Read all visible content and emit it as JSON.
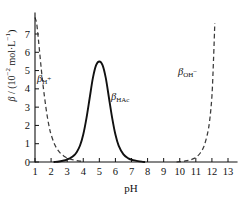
{
  "chart_data": {
    "type": "line",
    "title": "",
    "xlabel": "pH",
    "ylabel": "β / (10⁻² mol·L⁻¹)",
    "xlim": [
      1,
      13
    ],
    "ylim": [
      0,
      7.9
    ],
    "grid": false,
    "legend": "inline-annotations",
    "xticks": [
      "1",
      "2",
      "3",
      "4",
      "5",
      "6",
      "7",
      "8",
      "9",
      "10",
      "11",
      "12",
      "13"
    ],
    "xtick_values": [
      1,
      2,
      3,
      4,
      5,
      6,
      7,
      8,
      9,
      10,
      11,
      12,
      13
    ],
    "yticks": [
      "0",
      "1",
      "2",
      "3",
      "4",
      "5",
      "6",
      "7"
    ],
    "ytick_values": [
      0,
      1,
      2,
      3,
      4,
      5,
      6,
      7
    ],
    "series": [
      {
        "name": "β_H+",
        "label": "β",
        "label_sub": "H",
        "label_sup": "+",
        "style": "dashed",
        "color": "#3a3a3a",
        "x": [
          1.0,
          1.1,
          1.2,
          1.3,
          1.4,
          1.5,
          1.6,
          1.7,
          1.8,
          1.9,
          2.0,
          2.2,
          2.4,
          2.6,
          2.8,
          3.0,
          3.2,
          3.5,
          3.8,
          4.0
        ],
        "y": [
          7.9,
          7.6,
          6.8,
          5.9,
          5.0,
          4.2,
          3.5,
          2.85,
          2.3,
          1.85,
          1.5,
          1.0,
          0.68,
          0.46,
          0.32,
          0.22,
          0.16,
          0.09,
          0.05,
          0.04
        ]
      },
      {
        "name": "β_HAc",
        "label": "β",
        "label_sub": "HAc",
        "label_sup": "",
        "style": "solid",
        "color": "#111111",
        "x": [
          2.2,
          2.5,
          2.8,
          3.0,
          3.2,
          3.4,
          3.6,
          3.8,
          4.0,
          4.2,
          4.4,
          4.6,
          4.8,
          5.0,
          5.2,
          5.4,
          5.6,
          5.8,
          6.0,
          6.2,
          6.5,
          6.8,
          7.1,
          7.4,
          7.7,
          7.8
        ],
        "y": [
          0.0,
          0.03,
          0.08,
          0.14,
          0.22,
          0.34,
          0.55,
          0.9,
          1.5,
          2.4,
          3.5,
          4.6,
          5.3,
          5.5,
          5.3,
          4.6,
          3.5,
          2.4,
          1.5,
          0.9,
          0.42,
          0.2,
          0.1,
          0.05,
          0.01,
          0.0
        ]
      },
      {
        "name": "β_OH-",
        "label": "β",
        "label_sub": "OH",
        "label_sup": "−",
        "style": "dashed",
        "color": "#3a3a3a",
        "x": [
          9.8,
          10.0,
          10.3,
          10.6,
          10.9,
          11.1,
          11.3,
          11.5,
          11.7,
          11.85,
          12.0,
          12.1,
          12.18
        ],
        "y": [
          0.0,
          0.02,
          0.05,
          0.1,
          0.2,
          0.32,
          0.52,
          0.85,
          1.45,
          2.2,
          3.6,
          5.6,
          7.6
        ]
      }
    ],
    "annotations": [
      {
        "name": "beta-h-plus",
        "text": "β",
        "sub": "H",
        "sup": "+",
        "x": 2.2,
        "y": 4.6
      },
      {
        "name": "beta-hac",
        "text": "β",
        "sub": "HAc",
        "sup": "",
        "x": 6.6,
        "y": 3.6
      },
      {
        "name": "beta-oh-minus",
        "text": "β",
        "sub": "OH",
        "sup": "−",
        "x": 10.9,
        "y": 5.0
      }
    ]
  },
  "axes": {
    "x_title": "pH",
    "y_title_beta": "β",
    "y_title_rest": " / (10",
    "y_title_exp": "−2",
    "y_title_unit": " mol·L",
    "y_title_exp2": "−1",
    "y_title_close": ")"
  },
  "labels": {
    "beta_h": "β",
    "sub_h": "H",
    "sup_plus": "+",
    "beta_hac": "β",
    "sub_hac": "HAc",
    "beta_oh": "β",
    "sub_oh": "OH",
    "sup_minus": "−"
  }
}
